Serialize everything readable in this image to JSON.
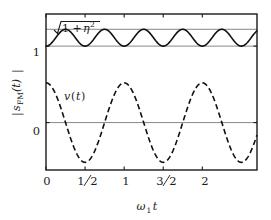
{
  "figure": {
    "background": "#ffffff",
    "frame_color": "#1a1a1a",
    "grid_color": "#888888",
    "curve_color": "#101010"
  },
  "chart_data": {
    "type": "line",
    "title": "",
    "xlabel": "ω₁t",
    "ylabel": "|s_FM(t)|",
    "xlim": [
      0,
      2.7
    ],
    "ylim": [
      -0.62,
      1.42
    ],
    "grid": false,
    "legend": "none",
    "xticks": [
      0,
      0.5,
      1,
      1.5,
      2
    ],
    "xticklabels": [
      "0",
      "1/2",
      "1",
      "3/2",
      "2"
    ],
    "yticks": [
      0,
      1
    ],
    "yticklabels": [
      "0",
      "1"
    ],
    "reference_lines": [
      {
        "name": "unity",
        "y": 1.0,
        "label": "1",
        "color": "#888888"
      },
      {
        "name": "envelope",
        "y": 1.22,
        "label": "sqrt(1+eta^2)",
        "color": "#888888"
      },
      {
        "name": "zero",
        "y": 0.0,
        "label": "0",
        "color": "#888888"
      }
    ],
    "series": [
      {
        "name": "|s_FM(t)|",
        "style": "solid",
        "color": "#101010",
        "linewidth": 1.6,
        "form": "envelope_ripple",
        "baseline": 1.0,
        "amplitude": 0.22,
        "ripple_periods_per_unit": 2,
        "phase": 0.5,
        "description": "Rectified FM envelope oscillating between 1 and sqrt(1+eta^2)",
        "x": [
          0,
          0.125,
          0.25,
          0.375,
          0.5,
          0.625,
          0.75,
          0.875,
          1.0,
          1.125,
          1.25,
          1.375,
          1.5,
          1.625,
          1.75,
          1.875,
          2.0,
          2.125,
          2.25,
          2.375,
          2.5,
          2.625,
          2.7
        ],
        "y": [
          1.0,
          1.11,
          1.22,
          1.11,
          1.0,
          1.11,
          1.22,
          1.11,
          1.0,
          1.11,
          1.22,
          1.11,
          1.0,
          1.11,
          1.22,
          1.11,
          1.0,
          1.11,
          1.22,
          1.11,
          1.0,
          1.11,
          1.05
        ]
      },
      {
        "name": "v(t)",
        "style": "dashed",
        "color": "#101010",
        "linewidth": 1.6,
        "form": "cosine",
        "amplitude": 0.52,
        "period": 1.0,
        "offset": 0.0,
        "description": "Modulating signal v(t), cosine of unit period in omega_1 t",
        "x": [
          0,
          0.125,
          0.25,
          0.375,
          0.5,
          0.625,
          0.75,
          0.875,
          1.0,
          1.125,
          1.25,
          1.375,
          1.5,
          1.625,
          1.75,
          1.875,
          2.0,
          2.125,
          2.25,
          2.375,
          2.5,
          2.625,
          2.7
        ],
        "y": [
          0.52,
          0.37,
          0.0,
          -0.37,
          -0.52,
          -0.37,
          0.0,
          0.37,
          0.52,
          0.37,
          0.0,
          -0.37,
          -0.52,
          -0.37,
          0.0,
          0.37,
          0.52,
          0.37,
          0.0,
          -0.37,
          -0.52,
          -0.37,
          -0.15
        ]
      }
    ],
    "annotations": [
      {
        "name": "envelope-annotation",
        "text": "sqrt(1+eta^2)",
        "radicand_prefix": "1 +",
        "radicand_symbol": "η",
        "radicand_exponent": "2",
        "x": 0.1,
        "y": 1.33
      },
      {
        "name": "modulation-annotation",
        "text": "v(t)",
        "symbol": "v",
        "argument": "t",
        "x": 0.28,
        "y": 0.42
      }
    ]
  },
  "labels": {
    "y_axis_main": "s",
    "y_axis_sub": "FM",
    "y_axis_arg": "(t)",
    "x_axis_main": "ω",
    "x_axis_sub": "1",
    "x_axis_var": "t",
    "tick_0": "0",
    "tick_1": "1",
    "x_tick_0": "0",
    "x_tick_half_num": "1",
    "x_tick_half_den": "2",
    "x_tick_1": "1",
    "x_tick_three_half_num": "3",
    "x_tick_three_half_den": "2",
    "x_tick_2": "2"
  }
}
